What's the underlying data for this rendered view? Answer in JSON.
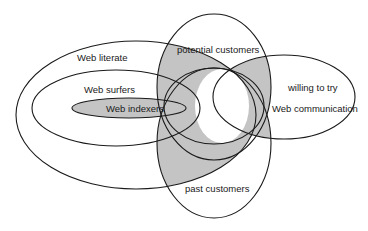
{
  "diagram": {
    "colors": {
      "background": "#ffffff",
      "stroke": "#1a1a1a",
      "shade": "#c4c4c4",
      "text": "#1a1a1a"
    },
    "sets": [
      {
        "id": "web-literate",
        "label": "Web literate"
      },
      {
        "id": "web-surfers",
        "label": "Web surfers"
      },
      {
        "id": "web-indexers",
        "label": "Web indexers"
      },
      {
        "id": "potential-customers",
        "label": "potential customers"
      },
      {
        "id": "past-customers",
        "label": "past customers"
      },
      {
        "id": "willing-to-try",
        "label": "willing to try"
      },
      {
        "id": "web-communication",
        "label": "Web communication"
      }
    ],
    "labels": {
      "web_literate": "Web literate",
      "web_surfers": "Web surfers",
      "web_indexers": "Web indexers",
      "potential_customers": "potential customers",
      "past_customers": "past customers",
      "willing_to_try": "willing to try",
      "web_communication": "Web communication"
    }
  }
}
